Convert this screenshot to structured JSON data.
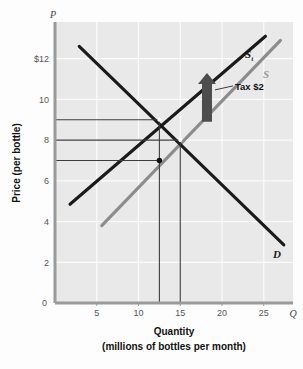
{
  "chart_data": {
    "type": "line",
    "title": "",
    "xlabel": "Quantity",
    "xlabel_sub": "(millions of bottles per month)",
    "ylabel": "Price (per bottle)",
    "x_axis_symbol": "Q",
    "y_axis_symbol": "P",
    "xlim": [
      0,
      28.5
    ],
    "ylim": [
      0,
      13.8
    ],
    "grid": true,
    "x_ticks": [
      "5",
      "10",
      "15",
      "20",
      "25"
    ],
    "x_tick_values": [
      5,
      10,
      15,
      20,
      25
    ],
    "y_ticks": [
      "2",
      "4",
      "6",
      "8",
      "10",
      "$12"
    ],
    "y_tick_values": [
      2,
      4,
      6,
      8,
      10,
      12
    ],
    "series": [
      {
        "name": "S_t",
        "label": "S",
        "label_subscript": "t",
        "role": "supply-with-tax",
        "color": "#1a1a1a",
        "x": [
          1.8,
          25.2
        ],
        "y": [
          4.85,
          13.1
        ]
      },
      {
        "name": "S",
        "label": "S",
        "label_subscript": "",
        "role": "supply",
        "color": "#8c8c8c",
        "x": [
          5.6,
          27.0
        ],
        "y": [
          3.8,
          12.9
        ]
      },
      {
        "name": "D",
        "label": "D",
        "label_subscript": "",
        "role": "demand",
        "color": "#1a1a1a",
        "x": [
          2.9,
          27.4
        ],
        "y": [
          12.6,
          2.85
        ]
      }
    ],
    "points": [
      {
        "name": "equilibrium-with-tax",
        "x": 12.5,
        "y": 9.0,
        "style": "open"
      },
      {
        "name": "equilibrium-no-tax",
        "x": 15.0,
        "y": 8.0,
        "style": "open"
      },
      {
        "name": "price-received-by-sellers",
        "x": 12.5,
        "y": 7.0,
        "style": "filled"
      }
    ],
    "guide_prices": [
      9,
      8,
      7
    ],
    "guide_quantities": [
      12.5,
      15
    ],
    "annotations": [
      {
        "name": "tax-arrow",
        "label": "Tax $2",
        "x": 18.2,
        "y_from": 8.9,
        "y_to": 11.3,
        "color": "#4d4d4d"
      }
    ]
  },
  "legend": {
    "supply_tax_label": "S",
    "supply_tax_subscript": "t",
    "supply_label": "S",
    "demand_label": "D"
  }
}
